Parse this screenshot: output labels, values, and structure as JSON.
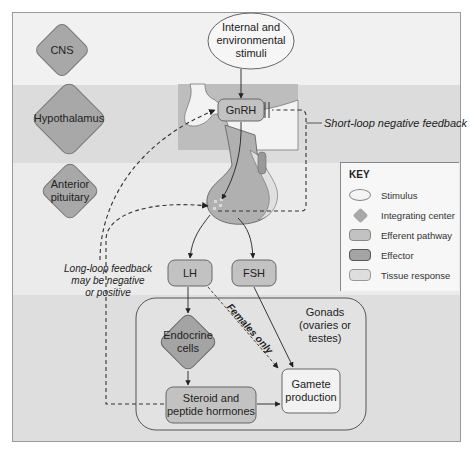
{
  "levels": {
    "cns": "CNS",
    "hypothalamus": "Hypothalamus",
    "anterior_pituitary_line1": "Anterior",
    "anterior_pituitary_line2": "pituitary"
  },
  "stimulus": {
    "line1": "Internal and",
    "line2": "environmental",
    "line3": "stimuli"
  },
  "hormones": {
    "gnrh": "GnRH",
    "lh": "LH",
    "fsh": "FSH"
  },
  "feedback": {
    "short_loop": "Short-loop negative feedback",
    "long_loop_line1": "Long-loop feedback",
    "long_loop_line2": "may be negative",
    "long_loop_line3": "or positive"
  },
  "gonads": {
    "title_line1": "Gonads",
    "title_line2": "(ovaries or testes)",
    "endocrine_line1": "Endocrine",
    "endocrine_line2": "cells",
    "steroid_line1": "Steroid and",
    "steroid_line2": "peptide hormones",
    "gamete_line1": "Gamete",
    "gamete_line2": "production",
    "females_only": "Females only"
  },
  "key": {
    "title": "KEY",
    "items": [
      {
        "shape": "ellipse",
        "label": "Stimulus",
        "color": "#f4f4f4"
      },
      {
        "shape": "diamond",
        "label": "Integrating center",
        "color": "#a8a8a8"
      },
      {
        "shape": "rounded-rect",
        "label": "Efferent pathway",
        "color": "#c2c2c2"
      },
      {
        "shape": "rounded-rect",
        "label": "Effector",
        "color": "#a4a4a4"
      },
      {
        "shape": "rounded-rect",
        "label": "Tissue response",
        "color": "#dedede"
      }
    ]
  },
  "colors": {
    "diamond_fill": "#a8a8a8",
    "efferent_fill": "#c2c2c2",
    "effector_fill": "#a4a4a4",
    "response_fill": "#f2f2f2",
    "stimulus_fill": "#f6f6f6"
  }
}
